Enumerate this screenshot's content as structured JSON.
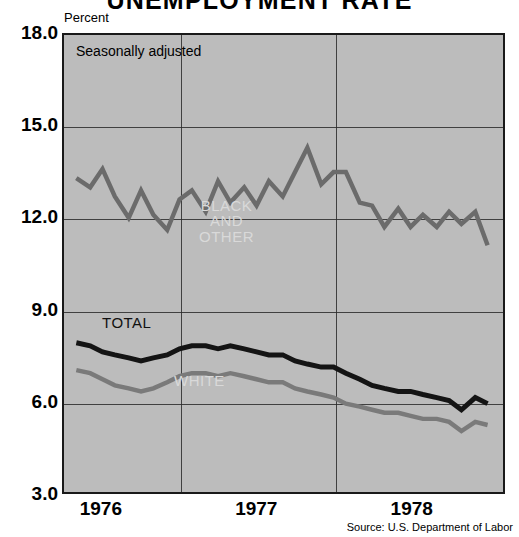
{
  "title": "UNEMPLOYMENT RATE",
  "unit_label": "Percent",
  "note": "Seasonally adjusted",
  "source": "Source: U.S. Department of Labor",
  "labels": {
    "black_and_other": "BLACK\nAND\nOTHER",
    "total": "TOTAL",
    "white": "WHITE"
  },
  "colors": {
    "plot_background": "#bcbcbc",
    "page_background": "#ffffff",
    "frame": "#1a1a1a",
    "grid": "#2a2a2a",
    "series_black_and_other": "#6b6b6b",
    "series_total": "#141414",
    "series_white": "#7a7a7a",
    "label_light": "#d9d9d9",
    "text": "#000000"
  },
  "chart_data": {
    "type": "line",
    "title": "UNEMPLOYMENT RATE",
    "subtitle": "Seasonally adjusted",
    "xlabel": "",
    "ylabel": "Percent",
    "ylim": [
      3.0,
      18.0
    ],
    "yticks": [
      18.0,
      15.0,
      12.0,
      9.0,
      6.0,
      3.0
    ],
    "ytick_labels": [
      "18.0",
      "15.0",
      "12.0",
      "9.0",
      "6.0",
      "3.0"
    ],
    "xlim": [
      1975.75,
      1978.6
    ],
    "xticks": [
      1976.0,
      1977.0,
      1978.0
    ],
    "xtick_labels": [
      "1976",
      "1977",
      "1978"
    ],
    "x_gridlines": [
      1976.5,
      1977.5
    ],
    "grid": true,
    "legend": "inline-annotations",
    "annotations": [
      {
        "text": "Seasonally adjusted",
        "x": 1975.85,
        "y": 17.4
      },
      {
        "text": "BLACK AND OTHER",
        "x": 1976.5,
        "y": 12.2
      },
      {
        "text": "TOTAL",
        "x": 1976.15,
        "y": 8.5
      },
      {
        "text": "WHITE",
        "x": 1976.55,
        "y": 6.5
      }
    ],
    "x": [
      1975.83,
      1975.92,
      1976.0,
      1976.08,
      1976.17,
      1976.25,
      1976.33,
      1976.42,
      1976.5,
      1976.58,
      1976.67,
      1976.75,
      1976.83,
      1976.92,
      1977.0,
      1977.08,
      1977.17,
      1977.25,
      1977.33,
      1977.42,
      1977.5,
      1977.58,
      1977.67,
      1977.75,
      1977.83,
      1977.92,
      1978.0,
      1978.08,
      1978.17,
      1978.25,
      1978.33,
      1978.42,
      1978.5
    ],
    "series": [
      {
        "name": "BLACK AND OTHER",
        "color": "#6b6b6b",
        "values": [
          13.3,
          13.0,
          13.6,
          12.7,
          12.0,
          12.9,
          12.1,
          11.6,
          12.6,
          12.9,
          12.2,
          13.2,
          12.5,
          13.0,
          12.4,
          13.2,
          12.7,
          13.5,
          14.3,
          13.1,
          13.5,
          13.5,
          12.5,
          12.4,
          11.7,
          12.3,
          11.7,
          12.1,
          11.7,
          12.2,
          11.8,
          12.2,
          11.1
        ]
      },
      {
        "name": "TOTAL",
        "color": "#141414",
        "values": [
          7.9,
          7.8,
          7.6,
          7.5,
          7.4,
          7.3,
          7.4,
          7.5,
          7.7,
          7.8,
          7.8,
          7.7,
          7.8,
          7.7,
          7.6,
          7.5,
          7.5,
          7.3,
          7.2,
          7.1,
          7.1,
          6.9,
          6.7,
          6.5,
          6.4,
          6.3,
          6.3,
          6.2,
          6.1,
          6.0,
          5.7,
          6.1,
          5.9
        ]
      },
      {
        "name": "WHITE",
        "color": "#7a7a7a",
        "values": [
          7.0,
          6.9,
          6.7,
          6.5,
          6.4,
          6.3,
          6.4,
          6.6,
          6.8,
          6.9,
          6.9,
          6.8,
          6.9,
          6.8,
          6.7,
          6.6,
          6.6,
          6.4,
          6.3,
          6.2,
          6.1,
          5.9,
          5.8,
          5.7,
          5.6,
          5.6,
          5.5,
          5.4,
          5.4,
          5.3,
          5.0,
          5.3,
          5.2
        ]
      }
    ]
  }
}
